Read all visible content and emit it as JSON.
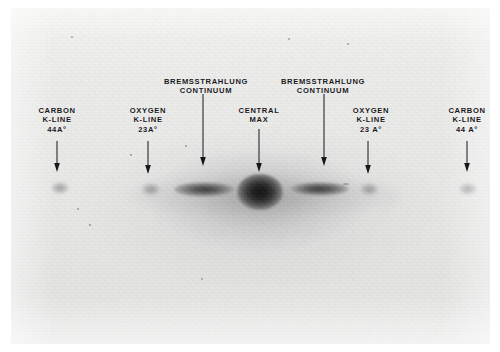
{
  "figure": {
    "kind": "x-ray-spectrum-plate-photograph",
    "plate_bg_color": "#e8e8e7",
    "ink_color": "#17171a",
    "page_bg_color": "#ffffff"
  },
  "annotations": [
    {
      "id": "carbon-left",
      "lines": [
        "CARBON",
        "K-LINE",
        "44A°"
      ],
      "label_x": 46,
      "label_y": 98,
      "arrow_x": 46,
      "arrow_top": 133,
      "arrow_len": 31
    },
    {
      "id": "oxygen-left",
      "lines": [
        "OXYGEN",
        "K-LINE",
        "23A°"
      ],
      "label_x": 137,
      "label_y": 98,
      "arrow_x": 137,
      "arrow_top": 133,
      "arrow_len": 33
    },
    {
      "id": "bremsstrahlung-left",
      "lines": [
        "BREMSSTRAHLUNG",
        "CONTINUUM"
      ],
      "label_x": 195,
      "label_y": 69,
      "arrow_x": 192,
      "arrow_top": 86,
      "arrow_len": 72
    },
    {
      "id": "central-max",
      "lines": [
        "CENTRAL",
        "MAX"
      ],
      "label_x": 248,
      "label_y": 98,
      "arrow_x": 248,
      "arrow_top": 121,
      "arrow_len": 43
    },
    {
      "id": "bremsstrahlung-right",
      "lines": [
        "BREMSSTRAHLUNG",
        "CONTINUUM"
      ],
      "label_x": 312,
      "label_y": 69,
      "arrow_x": 313,
      "arrow_top": 86,
      "arrow_len": 72
    },
    {
      "id": "oxygen-right",
      "lines": [
        "OXYGEN",
        "K-LINE",
        "23 A°"
      ],
      "label_x": 360,
      "label_y": 98,
      "arrow_x": 357,
      "arrow_top": 133,
      "arrow_len": 33
    },
    {
      "id": "carbon-right",
      "lines": [
        "CARBON",
        "K-LINE",
        "44 A°"
      ],
      "label_x": 456,
      "label_y": 98,
      "arrow_x": 456,
      "arrow_top": 133,
      "arrow_len": 31
    }
  ],
  "spectrum_features": [
    {
      "id": "haze-band",
      "type": "haze",
      "x": 120,
      "y": 168,
      "w": 270,
      "h": 40
    },
    {
      "id": "carbon-spot-left",
      "type": "spot-carb",
      "x": 40,
      "y": 174
    },
    {
      "id": "oxygen-spot-left",
      "type": "spot-oxy",
      "x": 130,
      "y": 175
    },
    {
      "id": "brems-streak-left",
      "type": "streak",
      "x": 163,
      "y": 174,
      "w": 62,
      "h": 15
    },
    {
      "id": "central-max-spot",
      "type": "spot-central",
      "x": 226,
      "y": 166
    },
    {
      "id": "brems-streak-right",
      "type": "streak",
      "x": 278,
      "y": 174,
      "w": 60,
      "h": 14
    },
    {
      "id": "oxygen-spot-right",
      "type": "spot-oxy",
      "x": 348,
      "y": 175
    },
    {
      "id": "carbon-spot-right",
      "type": "spot-carb",
      "x": 448,
      "y": 175
    }
  ]
}
